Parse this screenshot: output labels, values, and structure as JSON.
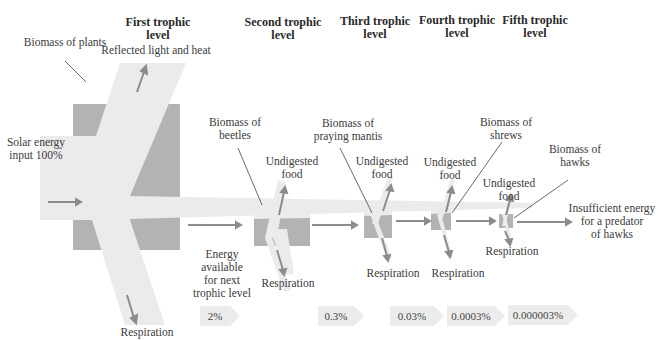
{
  "colors": {
    "biomass_box": "#b3b3b3",
    "flow_band": "#ebebeb",
    "arrow": "#8c8c8c",
    "pointer_line": "#444444",
    "percent_box": "#ececec"
  },
  "headers": [
    {
      "line1": "First trophic",
      "line2": "level"
    },
    {
      "line1": "Second trophic",
      "line2": "level"
    },
    {
      "line1": "Third trophic",
      "line2": "level"
    },
    {
      "line1": "Fourth trophic",
      "line2": "level"
    },
    {
      "line1": "Fifth trophic",
      "line2": "level"
    }
  ],
  "labels": {
    "reflected": "Reflected light and heat",
    "biomass_plants": "Biomass of plants",
    "solar_line1": "Solar energy",
    "solar_line2": "input 100%",
    "respiration_plants": "Respiration",
    "energy_avail": [
      "Energy",
      "available",
      "for next",
      "trophic level"
    ],
    "biomass_beetles": [
      "Biomass of",
      "beetles"
    ],
    "biomass_mantis": [
      "Biomass of",
      "praying mantis"
    ],
    "biomass_shrews": [
      "Biomass of",
      "shrews"
    ],
    "biomass_hawks": [
      "Biomass of",
      "hawks"
    ],
    "undigested": [
      "Undigested",
      "food"
    ],
    "respiration": "Respiration",
    "insufficient": [
      "Insufficient energy",
      "for a predator",
      "of hawks"
    ]
  },
  "percentages": [
    "2%",
    "0.3%",
    "0.03%",
    "0.0003%",
    "0.000003%"
  ]
}
